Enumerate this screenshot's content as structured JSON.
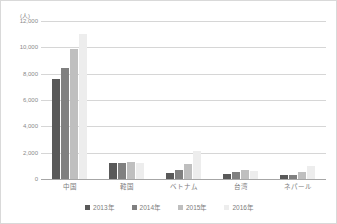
{
  "chart_data": {
    "type": "bar",
    "title": "",
    "subtitle": "",
    "xlabel": "",
    "ylabel": "(人)",
    "unit_label": "(人)",
    "categories": [
      "中国",
      "韓国",
      "ベトナム",
      "台湾",
      "ネパール"
    ],
    "series": [
      {
        "name": "2013年",
        "color": "#595959",
        "values": [
          7600,
          1230,
          450,
          400,
          330
        ]
      },
      {
        "name": "2014年",
        "color": "#808080",
        "values": [
          8400,
          1240,
          650,
          500,
          300
        ]
      },
      {
        "name": "2015年",
        "color": "#bfbfbf",
        "values": [
          9900,
          1280,
          1150,
          660,
          520
        ]
      },
      {
        "name": "2016年",
        "color": "#ededed",
        "values": [
          11050,
          1210,
          2120,
          600,
          1010
        ]
      }
    ],
    "ylim": [
      0,
      12000
    ],
    "yticks": [
      0,
      2000,
      4000,
      6000,
      8000,
      10000,
      12000
    ],
    "ytick_labels": [
      "0",
      "2,000",
      "4,000",
      "6,000",
      "8,000",
      "10,000",
      "12,000"
    ],
    "grid": true,
    "legend_position": "bottom"
  },
  "legend": {
    "items": [
      {
        "label": "2013年",
        "color": "#595959"
      },
      {
        "label": "2014年",
        "color": "#808080"
      },
      {
        "label": "2015年",
        "color": "#bfbfbf"
      },
      {
        "label": "2016年",
        "color": "#ededed"
      }
    ]
  }
}
